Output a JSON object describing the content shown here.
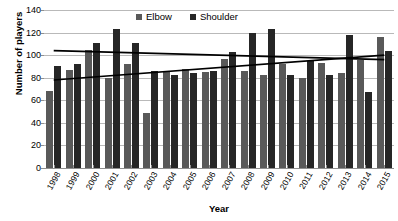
{
  "chart_data": {
    "type": "bar",
    "title": "",
    "xlabel": "Year",
    "ylabel": "Number of players",
    "ylim": [
      0,
      140
    ],
    "yticks": [
      0,
      20,
      40,
      60,
      80,
      100,
      120,
      140
    ],
    "grid": true,
    "legend_position": "top-center",
    "categories": [
      "1998",
      "1999",
      "2000",
      "2001",
      "2002",
      "2003",
      "2004",
      "2005",
      "2006",
      "2007",
      "2008",
      "2009",
      "2010",
      "2011",
      "2012",
      "2013",
      "2014",
      "2015"
    ],
    "series": [
      {
        "name": "Elbow",
        "color": "#595959",
        "values": [
          68,
          87,
          105,
          80,
          92,
          49,
          85,
          88,
          85,
          97,
          86,
          82,
          92,
          80,
          93,
          84,
          96,
          116
        ]
      },
      {
        "name": "Shoulder",
        "color": "#262626",
        "values": [
          90,
          92,
          111,
          123,
          111,
          86,
          82,
          84,
          86,
          103,
          120,
          123,
          82,
          95,
          82,
          118,
          67,
          104
        ]
      }
    ],
    "trendlines": [
      {
        "name": "Shoulder trendline",
        "series": "Shoulder",
        "color": "#000000",
        "start": {
          "x": "1998",
          "y": 104
        },
        "end": {
          "x": "2015",
          "y": 96
        }
      },
      {
        "name": "Elbow trendline",
        "series": "Elbow",
        "color": "#000000",
        "start": {
          "x": "1998",
          "y": 78
        },
        "end": {
          "x": "2015",
          "y": 100
        }
      }
    ]
  },
  "legend": {
    "items": [
      {
        "label": "Elbow"
      },
      {
        "label": "Shoulder"
      }
    ]
  },
  "axis": {
    "y_title": "Number of players",
    "x_title": "Year"
  }
}
